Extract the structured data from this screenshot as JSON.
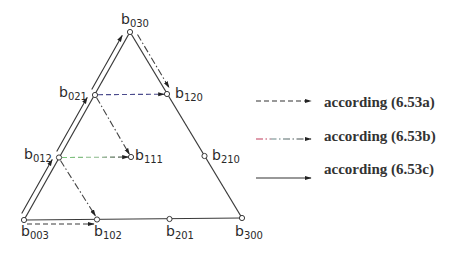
{
  "diagram": {
    "nodes": {
      "b030": {
        "base": "b",
        "sub": "030"
      },
      "b021": {
        "base": "b",
        "sub": "021"
      },
      "b120": {
        "base": "b",
        "sub": "120"
      },
      "b012": {
        "base": "b",
        "sub": "012"
      },
      "b111": {
        "base": "b",
        "sub": "111"
      },
      "b210": {
        "base": "b",
        "sub": "210"
      },
      "b003": {
        "base": "b",
        "sub": "003"
      },
      "b102": {
        "base": "b",
        "sub": "102"
      },
      "b201": {
        "base": "b",
        "sub": "201"
      },
      "b300": {
        "base": "b",
        "sub": "300"
      }
    },
    "arrows": [
      {
        "from": "b003",
        "to": "b012",
        "style": "solid"
      },
      {
        "from": "b012",
        "to": "b021",
        "style": "solid"
      },
      {
        "from": "b021",
        "to": "b030",
        "style": "solid"
      },
      {
        "from": "b030",
        "to": "b120",
        "style": "dash-dot"
      },
      {
        "from": "b021",
        "to": "b111",
        "style": "dash-dot"
      },
      {
        "from": "b012",
        "to": "b102",
        "style": "dash-dot"
      },
      {
        "from": "b021",
        "to": "b120",
        "style": "dashed"
      },
      {
        "from": "b012",
        "to": "b111",
        "style": "dashed"
      },
      {
        "from": "b003",
        "to": "b102",
        "style": "dashed"
      }
    ]
  },
  "legend": [
    {
      "style": "dashed",
      "label": "according (6.53a)"
    },
    {
      "style": "dash-dot",
      "label": "according (6.53b)"
    },
    {
      "style": "solid",
      "label": "according (6.53c)"
    }
  ],
  "colors": {
    "line": "#333333",
    "dashed_blue": "#4b4b8c",
    "dashed_green": "#7cc47c",
    "legend_red": "#c03a5a"
  }
}
